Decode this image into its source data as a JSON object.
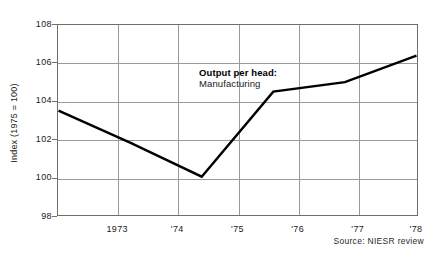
{
  "chart_data": {
    "type": "line",
    "title": "",
    "subtitle": "",
    "xlabel": "",
    "ylabel": "Index (1975 = 100)",
    "x": [
      1973,
      1974,
      1975,
      1976,
      1977,
      1978
    ],
    "xtick_labels": [
      "1973",
      "'74",
      "'75",
      "'76",
      "'77",
      "'78"
    ],
    "ytick_labels": [
      "108",
      "106",
      "104",
      "102",
      "100",
      "98"
    ],
    "ytick_values": [
      108,
      106,
      104,
      102,
      100,
      98
    ],
    "ylim": [
      98,
      108
    ],
    "xlim": [
      1973,
      1978
    ],
    "grid": true,
    "legend": "none",
    "series": [
      {
        "name": "Output per head: Manufacturing",
        "values": [
          103.5,
          101.8,
          100.0,
          104.5,
          105.0,
          106.4
        ],
        "color": "#000000"
      }
    ],
    "annotations": [
      {
        "line1": "Output per head:",
        "line2": "Manufacturing"
      }
    ],
    "source": "Source: NIESR review"
  },
  "axes": {
    "y_title": "Index (1975 = 100)",
    "y_ticks": [
      "108",
      "106",
      "104",
      "102",
      "100",
      "98"
    ],
    "x_ticks": [
      "1973",
      "'74",
      "'75",
      "'76",
      "'77",
      "'78"
    ]
  },
  "annotation": {
    "heading": "Output per head:",
    "subheading": "Manufacturing"
  },
  "footer": {
    "source": "Source: NIESR review"
  },
  "colors": {
    "line": "#000000",
    "grid": "#9a9a9a",
    "frame": "#6e6e6e",
    "text": "#1a1a1a",
    "background": "#ffffff"
  }
}
